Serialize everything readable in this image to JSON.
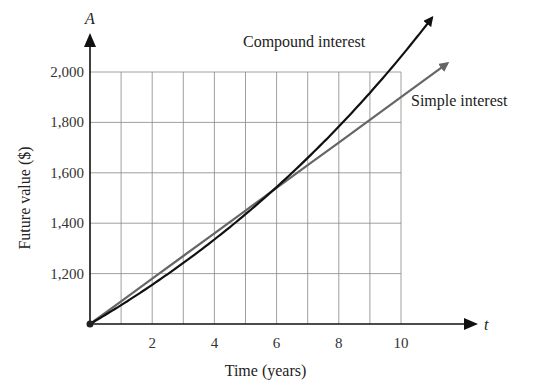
{
  "chart_data": {
    "type": "line",
    "title": "",
    "xlabel": "Time (years)",
    "ylabel": "Future value ($)",
    "x_axis_letter": "t",
    "y_axis_letter": "A",
    "xlim": [
      0,
      10
    ],
    "ylim": [
      1000,
      2000
    ],
    "x_ticks": [
      2,
      4,
      6,
      8,
      10
    ],
    "x_tick_labels": [
      "2",
      "4",
      "6",
      "8",
      "10"
    ],
    "y_ticks": [
      1200,
      1400,
      1600,
      1800,
      2000
    ],
    "y_tick_labels": [
      "1,200",
      "1,400",
      "1,600",
      "1,800",
      "2,000"
    ],
    "grid": true,
    "x_grid_step": 1,
    "y_grid_step": 200,
    "series": [
      {
        "name": "Compound interest",
        "color": "#111111",
        "x": [
          0,
          1,
          2,
          3,
          4,
          5,
          6,
          7,
          8,
          9,
          10,
          11
        ],
        "values": [
          1000,
          1075,
          1156,
          1242,
          1335,
          1436,
          1543,
          1659,
          1783,
          1917,
          2061,
          2216
        ]
      },
      {
        "name": "Simple interest",
        "color": "#666666",
        "x": [
          0,
          1,
          2,
          3,
          4,
          5,
          6,
          7,
          8,
          9,
          10,
          11.5
        ],
        "values": [
          1000,
          1090,
          1180,
          1270,
          1360,
          1450,
          1540,
          1630,
          1720,
          1810,
          1900,
          2035
        ]
      }
    ],
    "annotations": [
      "Compound interest",
      "Simple interest"
    ],
    "origin_point": {
      "x": 0,
      "y": 1000
    }
  }
}
